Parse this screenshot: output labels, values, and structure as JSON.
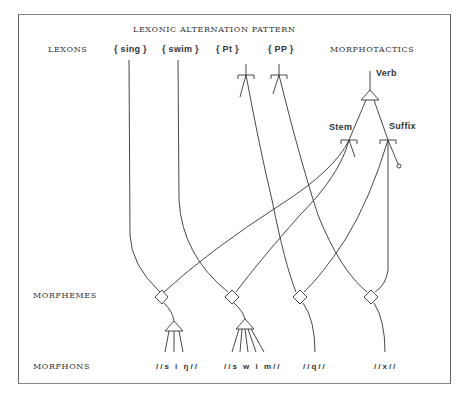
{
  "caption": "",
  "diagram": {
    "title": "LEXONIC ALTERNATION PATTERN",
    "row_labels": {
      "lexons": "LEXONS",
      "morphotactics": "MORPHOTACTICS",
      "morphemes": "MORPHEMES",
      "morphons": "MORPHONS"
    },
    "lexons": [
      {
        "id": "sing",
        "label": "{ sing }"
      },
      {
        "id": "swim",
        "label": "{ swim }"
      },
      {
        "id": "pt",
        "label": "{ Pt }"
      },
      {
        "id": "pp",
        "label": "{ PP }"
      }
    ],
    "morphotactics": {
      "verb": "Verb",
      "stem": "Stem",
      "suffix": "Suffix"
    },
    "morphons": [
      {
        "id": "sing",
        "label": "//s i ŋ//"
      },
      {
        "id": "swim",
        "label": "//s w i m//"
      },
      {
        "id": "q",
        "label": "//q//"
      },
      {
        "id": "x",
        "label": "//x//"
      }
    ],
    "colors": {
      "line": "#333333",
      "frame": "#666666",
      "text": "#333333"
    }
  }
}
